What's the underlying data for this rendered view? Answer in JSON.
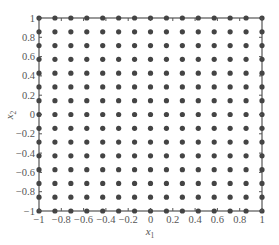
{
  "chart_data": {
    "type": "scatter",
    "title": "",
    "xlabel": "x1",
    "ylabel": "x2",
    "xlim": [
      -1,
      1
    ],
    "ylim": [
      -1,
      1
    ],
    "grid": false,
    "legend": null,
    "xticks": [
      -1,
      -0.8,
      -0.6,
      -0.4,
      -0.2,
      0,
      0.2,
      0.4,
      0.6,
      0.8,
      1
    ],
    "yticks": [
      -1,
      -0.8,
      -0.6,
      -0.4,
      -0.2,
      0,
      0.2,
      0.4,
      0.6,
      0.8,
      1
    ],
    "xtick_labels": [
      "−1",
      "−0.8",
      "−0.6",
      "−0.4",
      "−0.2",
      "0",
      "0.2",
      "0.4",
      "0.6",
      "0.8",
      "1"
    ],
    "ytick_labels": [
      "−1",
      "−0.8",
      "−0.6",
      "−0.4",
      "−0.2",
      "0",
      "0.2",
      "0.4",
      "0.6",
      "0.8",
      "1"
    ],
    "grid_points_per_axis": 15,
    "point_coordinates_1d": [
      -1,
      -0.857,
      -0.714,
      -0.571,
      -0.429,
      -0.286,
      -0.143,
      0,
      0.143,
      0.286,
      0.429,
      0.571,
      0.714,
      0.857,
      1
    ],
    "series": [
      {
        "name": "grid points",
        "description": "15 x 15 uniform grid of points covering [-1,1] x [-1,1]",
        "marker_color": "#444444"
      }
    ]
  },
  "labels": {
    "x_main": "x",
    "x_sub": "1",
    "y_main": "x",
    "y_sub": "2"
  },
  "colors": {
    "marker": "#444444",
    "axis": "#555555"
  }
}
